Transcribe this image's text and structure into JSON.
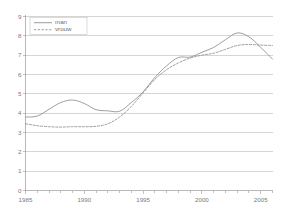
{
  "chart_data": {
    "type": "line",
    "title": "",
    "subtitle": "",
    "xlabel": "",
    "ylabel": "",
    "xlim": [
      1985,
      2006
    ],
    "ylim": [
      0,
      9
    ],
    "grid": true,
    "grid_axis": "y",
    "legend_position": "top-left",
    "x": [
      1985,
      1986,
      1987,
      1988,
      1989,
      1990,
      1991,
      1992,
      1993,
      1994,
      1995,
      1996,
      1997,
      1998,
      1999,
      2000,
      2001,
      2002,
      2003,
      2004,
      2005,
      2006
    ],
    "xticks": [
      1985,
      1990,
      1995,
      2000,
      2005
    ],
    "xtick_labels": [
      "1985",
      "1990",
      "1995",
      "2000",
      "2005"
    ],
    "xminor_ticks": [
      1986,
      1987,
      1988,
      1989,
      1991,
      1992,
      1993,
      1994,
      1996,
      1997,
      1998,
      1999,
      2001,
      2002,
      2003,
      2004,
      2006
    ],
    "yticks": [
      0,
      1,
      2,
      3,
      4,
      5,
      6,
      7,
      8,
      9
    ],
    "ytick_labels": [
      "0",
      "1",
      "2",
      "3",
      "4",
      "5",
      "6",
      "7",
      "8",
      "9"
    ],
    "series": [
      {
        "name": "man",
        "style": "solid",
        "color": "#8c8c8c",
        "values": [
          3.8,
          3.85,
          4.2,
          4.55,
          4.68,
          4.5,
          4.18,
          4.12,
          4.1,
          4.55,
          5.1,
          5.85,
          6.45,
          6.88,
          6.9,
          7.15,
          7.4,
          7.8,
          8.15,
          7.95,
          7.4,
          6.8
        ]
      },
      {
        "name": "vrouw",
        "style": "dashed",
        "color": "#8c8c8c",
        "values": [
          3.45,
          3.35,
          3.3,
          3.28,
          3.3,
          3.3,
          3.32,
          3.45,
          3.8,
          4.35,
          5.05,
          5.75,
          6.25,
          6.6,
          6.85,
          7.0,
          7.1,
          7.3,
          7.5,
          7.55,
          7.52,
          7.5
        ]
      }
    ]
  },
  "legend": {
    "entries": [
      {
        "label": "man"
      },
      {
        "label": "vrouw"
      }
    ]
  },
  "colors": {
    "gridline": "#b9b9b9",
    "axis": "#9a9a9a",
    "text": "#7a7a7a",
    "series": "#8c8c8c",
    "background": "#ffffff"
  }
}
